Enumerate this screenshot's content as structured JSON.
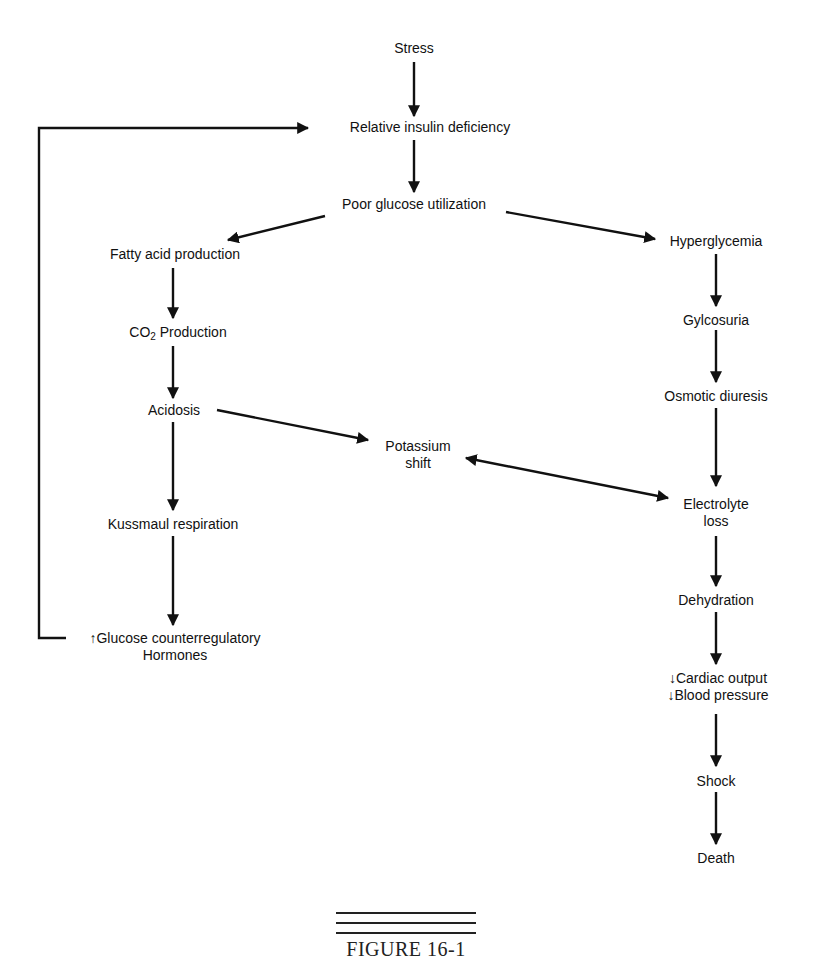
{
  "diagram": {
    "nodes": {
      "stress": "Stress",
      "relative_insulin_deficiency": "Relative insulin deficiency",
      "poor_glucose_utilization": "Poor glucose utilization",
      "fatty_acid_production": "Fatty acid production",
      "co2_production_prefix": "CO",
      "co2_production_sub": "2",
      "co2_production_suffix": " Production",
      "acidosis": "Acidosis",
      "kussmaul_respiration": "Kussmaul respiration",
      "glucose_counterregulatory_line1": "↑Glucose counterregulatory",
      "glucose_counterregulatory_line2": "Hormones",
      "hyperglycemia": "Hyperglycemia",
      "glycosuria": "Gylcosuria",
      "osmotic_diuresis": "Osmotic diuresis",
      "potassium_shift_line1": "Potassium",
      "potassium_shift_line2": "shift",
      "electrolyte_loss_line1": "Electrolyte",
      "electrolyte_loss_line2": "loss",
      "dehydration": "Dehydration",
      "cardiac_output": "↓Cardiac output",
      "blood_pressure": "↓Blood pressure",
      "shock": "Shock",
      "death": "Death"
    },
    "edges": [
      {
        "from": "Stress",
        "to": "Relative insulin deficiency"
      },
      {
        "from": "Relative insulin deficiency",
        "to": "Poor glucose utilization"
      },
      {
        "from": "Poor glucose utilization",
        "to": "Fatty acid production"
      },
      {
        "from": "Poor glucose utilization",
        "to": "Hyperglycemia"
      },
      {
        "from": "Fatty acid production",
        "to": "CO2 Production"
      },
      {
        "from": "CO2 Production",
        "to": "Acidosis"
      },
      {
        "from": "Acidosis",
        "to": "Potassium shift"
      },
      {
        "from": "Acidosis",
        "to": "Kussmaul respiration"
      },
      {
        "from": "Kussmaul respiration",
        "to": "↑Glucose counterregulatory Hormones"
      },
      {
        "from": "↑Glucose counterregulatory Hormones",
        "to": "Relative insulin deficiency"
      },
      {
        "from": "Hyperglycemia",
        "to": "Gylcosuria"
      },
      {
        "from": "Gylcosuria",
        "to": "Osmotic diuresis"
      },
      {
        "from": "Osmotic diuresis",
        "to": "Electrolyte loss"
      },
      {
        "from": "Potassium shift",
        "to": "Electrolyte loss",
        "bidirectional": true
      },
      {
        "from": "Electrolyte loss",
        "to": "Dehydration"
      },
      {
        "from": "Dehydration",
        "to": "↓Cardiac output ↓Blood pressure"
      },
      {
        "from": "↓Cardiac output ↓Blood pressure",
        "to": "Shock"
      },
      {
        "from": "Shock",
        "to": "Death"
      }
    ]
  },
  "caption": "FIGURE 16-1"
}
